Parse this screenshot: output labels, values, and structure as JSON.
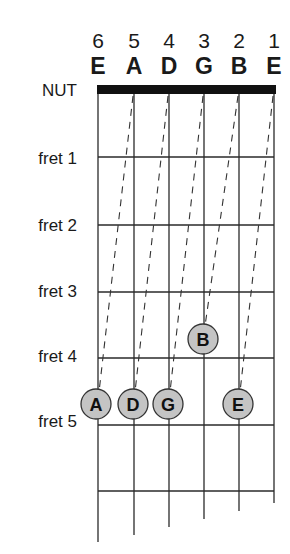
{
  "diagram": {
    "strings": [
      {
        "number": "6",
        "name": "E"
      },
      {
        "number": "5",
        "name": "A"
      },
      {
        "number": "4",
        "name": "D"
      },
      {
        "number": "3",
        "name": "G"
      },
      {
        "number": "2",
        "name": "B"
      },
      {
        "number": "1",
        "name": "E"
      }
    ],
    "nut_label": "NUT",
    "fret_labels": [
      "fret 1",
      "fret 2",
      "fret 3",
      "fret 4",
      "fret 5"
    ],
    "notes": [
      {
        "label": "A",
        "string": 6,
        "fret": 5
      },
      {
        "label": "D",
        "string": 5,
        "fret": 5
      },
      {
        "label": "G",
        "string": 4,
        "fret": 5
      },
      {
        "label": "B",
        "string": 3,
        "fret": 4
      },
      {
        "label": "E",
        "string": 2,
        "fret": 5
      }
    ],
    "colors": {
      "line": "#2a2a2a",
      "nut": "#111111",
      "note_fill": "#c4c4c4",
      "note_stroke": "#333333"
    }
  }
}
